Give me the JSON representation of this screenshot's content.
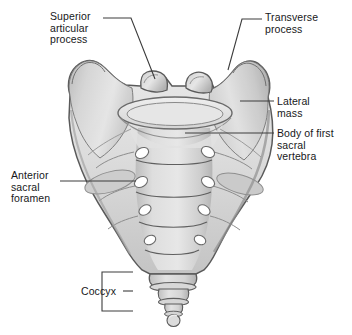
{
  "figure": {
    "background_color": "#ffffff",
    "width": 352,
    "height": 335
  },
  "labels": [
    {
      "id": "superior-articular-process",
      "text": "Superior\narticular\nprocess",
      "lines": [
        "Superior",
        "articular",
        "process"
      ],
      "x": 50,
      "y": 11,
      "align": "left",
      "leader": "polyline from text right edge horizontally then diagonally down-right to the superior articular process"
    },
    {
      "id": "transverse-process",
      "text": "Transverse\nprocess",
      "lines": [
        "Transverse",
        "process"
      ],
      "x": 265,
      "y": 12,
      "align": "left",
      "leader": "polyline from text left edge horizontally then diagonally down-left to the transverse process"
    },
    {
      "id": "lateral-mass",
      "text": "Lateral\nmass",
      "lines": [
        "Lateral",
        "mass"
      ],
      "x": 277,
      "y": 96,
      "align": "left",
      "leader": "horizontal line left to the lateral mass (ala)"
    },
    {
      "id": "body-of-first-sacral-vertebra",
      "text": "Body of first\nsacral\nvertebra",
      "lines": [
        "Body of first",
        "sacral",
        "vertebra"
      ],
      "x": 277,
      "y": 128,
      "align": "left",
      "leader": "horizontal line left to the body of the first sacral vertebra"
    },
    {
      "id": "anterior-sacral-foramen",
      "text": "Anterior\nsacral\nforamen",
      "lines": [
        "Anterior",
        "sacral",
        "foramen"
      ],
      "x": 11,
      "y": 170,
      "align": "left",
      "leader": "horizontal line right to an anterior sacral foramen"
    },
    {
      "id": "coccyx",
      "text": "Coccyx",
      "lines": [
        "Coccyx"
      ],
      "x": 81,
      "y": 286,
      "align": "left",
      "leader": "short horizontal line right to a square bracket enclosing the coccyx"
    }
  ],
  "colors": {
    "outline": "#4a4a4a",
    "bone_light": "#e8e8e8",
    "bone_mid": "#d2d2d2",
    "bone_shadow": "#b4b4b4",
    "bone_dark": "#9a9a9a",
    "foramen_fill": "#ffffff",
    "text": "#17181a",
    "leader_line": "#3c3c3c",
    "background": "#ffffff"
  },
  "anatomy": {
    "structures": [
      "sacrum",
      "lateral mass (ala) left",
      "lateral mass (ala) right",
      "superior articular process left",
      "superior articular process right",
      "transverse process left",
      "transverse process right",
      "body of first sacral vertebra",
      "transverse ridges",
      "anterior sacral foramina",
      "coccyx"
    ],
    "foramina_pairs": 4,
    "coccyx_segments": 4,
    "transverse_ridges": 4,
    "view": "anterior"
  }
}
